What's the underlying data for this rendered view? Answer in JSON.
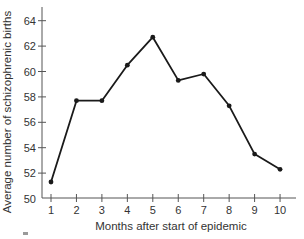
{
  "chart_data": {
    "type": "line",
    "title": "",
    "xlabel": "Months after start of epidemic",
    "ylabel": "Average number of schizophrenic births",
    "x": [
      1,
      2,
      3,
      4,
      5,
      6,
      7,
      8,
      9,
      10
    ],
    "categories": [
      "1",
      "2",
      "3",
      "4",
      "5",
      "6",
      "7",
      "8",
      "9",
      "10"
    ],
    "series": [
      {
        "name": "Average schizophrenic births",
        "values": [
          51.3,
          57.7,
          57.7,
          60.5,
          62.7,
          59.3,
          59.8,
          57.3,
          53.5,
          52.3
        ],
        "color": "#1a1a1a",
        "marker": "circle"
      }
    ],
    "yticks": [
      50,
      52,
      54,
      56,
      58,
      60,
      62,
      64
    ],
    "ytick_labels": [
      "50",
      "52",
      "54",
      "56",
      "58",
      "60",
      "62",
      "64"
    ],
    "xticks": [
      1,
      2,
      3,
      4,
      5,
      6,
      7,
      8,
      9,
      10
    ],
    "xtick_labels": [
      "1",
      "2",
      "3",
      "4",
      "5",
      "6",
      "7",
      "8",
      "9",
      "10"
    ],
    "ylim": [
      50,
      65
    ],
    "xlim": [
      0.6,
      10.6
    ],
    "grid": false,
    "legend": "none"
  },
  "colors": {
    "line": "#1a1a1a",
    "axis": "#555555",
    "text": "#333333"
  }
}
